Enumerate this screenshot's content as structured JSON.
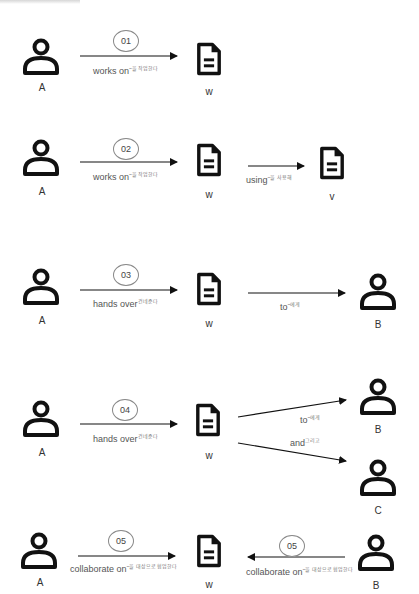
{
  "panels": [
    {
      "id": "01",
      "badge": "01",
      "rel1": "works on",
      "rel1_ko": "~을 작업한다",
      "nodes": {
        "a": "A",
        "w": "w"
      }
    },
    {
      "id": "02",
      "badge": "02",
      "rel1": "works on",
      "rel1_ko": "~을 작업한다",
      "rel2": "using",
      "rel2_ko": "~을 사용해",
      "nodes": {
        "a": "A",
        "w": "w",
        "v": "v"
      }
    },
    {
      "id": "03",
      "badge": "03",
      "rel1": "hands over",
      "rel1_ko": "건네준다",
      "rel2": "to",
      "rel2_ko": "~에게",
      "nodes": {
        "a": "A",
        "w": "w",
        "b": "B"
      }
    },
    {
      "id": "04",
      "badge": "04",
      "rel1": "hands over",
      "rel1_ko": "건네준다",
      "rel2": "to",
      "rel2_ko": "~에게",
      "rel3": "and",
      "rel3_ko": "그리고",
      "nodes": {
        "a": "A",
        "w": "w",
        "b": "B",
        "c": "C"
      }
    },
    {
      "id": "05",
      "badge_left": "05",
      "badge_right": "05",
      "rel1": "collaborate on",
      "rel1_ko": "~을 대상으로 협업한다",
      "rel2": "collaborate on",
      "rel2_ko": "~을 대상으로 협업한다",
      "nodes": {
        "a": "A",
        "w": "w",
        "b": "B"
      }
    }
  ],
  "icons": {
    "person": "person-icon",
    "document": "document-icon"
  }
}
